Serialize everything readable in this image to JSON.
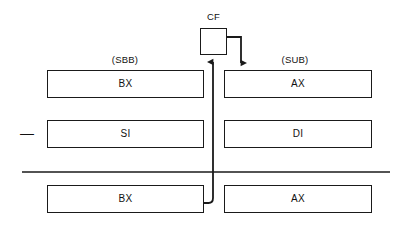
{
  "diagram": {
    "type": "cpu-register-subtract-with-borrow",
    "flag": {
      "name": "CF",
      "box": {
        "x": 200,
        "y": 28,
        "w": 27,
        "h": 27
      }
    },
    "operations": [
      {
        "id": "left-op",
        "label": "(SBB)",
        "x": 125,
        "y": 58
      },
      {
        "id": "right-op",
        "label": "(SUB)",
        "x": 295,
        "y": 58
      }
    ],
    "minus_operator": {
      "symbol": "—",
      "x": 24,
      "y": 129
    },
    "rows": [
      {
        "id": "row-operand-high",
        "left": {
          "name": "BX",
          "x": 47,
          "y": 70,
          "w": 157,
          "h": 28
        },
        "right": {
          "name": "AX",
          "x": 224,
          "y": 70,
          "w": 148,
          "h": 28
        }
      },
      {
        "id": "row-operand-low",
        "left": {
          "name": "SI",
          "x": 47,
          "y": 120,
          "w": 157,
          "h": 28
        },
        "right": {
          "name": "DI",
          "x": 224,
          "y": 120,
          "w": 148,
          "h": 28
        }
      },
      {
        "id": "row-result",
        "left": {
          "name": "BX",
          "x": 47,
          "y": 185,
          "w": 157,
          "h": 28
        },
        "right": {
          "name": "AX",
          "x": 224,
          "y": 185,
          "w": 148,
          "h": 28
        }
      }
    ],
    "separator_rule": {
      "x1": 22,
      "y": 172,
      "x2": 390
    },
    "connectors": [
      {
        "id": "borrow-out-to-cf",
        "from": "row-result.left.right-edge",
        "to": "CF.bottom",
        "arrow": "up"
      },
      {
        "id": "cf-to-sub-operand",
        "from": "CF.right",
        "to": "row-operand-high.right.top",
        "arrow": "down"
      }
    ],
    "stroke_color": "#1a1a1a",
    "background_color": "#ffffff"
  }
}
